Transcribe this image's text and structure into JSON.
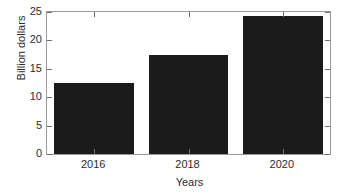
{
  "chart_data": {
    "type": "bar",
    "title": "",
    "categories": [
      "2016",
      "2018",
      "2020"
    ],
    "values": [
      12.5,
      17.5,
      24.3
    ],
    "xlabel": "Years",
    "ylabel": "Billion dollars",
    "ylim": [
      0,
      25
    ],
    "yticks": [
      0,
      5,
      10,
      15,
      20,
      25
    ],
    "ytick_labels": [
      "0",
      "5",
      "10",
      "15",
      "20",
      "25"
    ],
    "xtick_labels": [
      "2016",
      "2018",
      "2020"
    ],
    "grid": false,
    "legend": null,
    "bar_color": "#1b1b1b",
    "axis_color": "#9a9a9a",
    "background_color": "#ffffff"
  },
  "axes": {
    "y_title": "Billion dollars",
    "x_title": "Years"
  }
}
